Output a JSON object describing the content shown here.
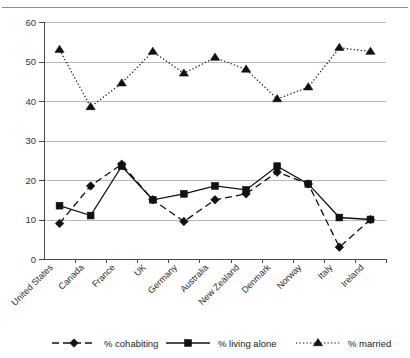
{
  "chart_data": {
    "type": "line",
    "title": "",
    "xlabel": "",
    "ylabel": "",
    "ylim": [
      0,
      60
    ],
    "ytick_step": 10,
    "yticks": [
      0,
      10,
      20,
      30,
      40,
      50,
      60
    ],
    "grid": "horizontal",
    "legend_position": "bottom",
    "categories": [
      "United States",
      "Canada",
      "France",
      "UK",
      "Germany",
      "Australia",
      "New Zealand",
      "Denmark",
      "Norway",
      "Italy",
      "Ireland"
    ],
    "series": [
      {
        "name": "% cohabiting",
        "marker": "diamond",
        "linestyle": "dashed",
        "color": "#111111",
        "values": [
          9,
          18.5,
          24,
          15,
          9.5,
          15,
          16.5,
          22,
          19,
          3,
          10
        ]
      },
      {
        "name": "% living alone",
        "marker": "square",
        "linestyle": "solid",
        "color": "#111111",
        "values": [
          13.5,
          11,
          23.5,
          15,
          16.5,
          18.5,
          17.5,
          23.5,
          19,
          10.5,
          10
        ]
      },
      {
        "name": "% married",
        "marker": "triangle",
        "linestyle": "dotted",
        "color": "#111111",
        "values": [
          53,
          38.5,
          44.5,
          52.5,
          47,
          51,
          48,
          40.5,
          43.5,
          53.5,
          52.5
        ]
      }
    ]
  },
  "axis": {
    "y_labels": [
      "60",
      "50",
      "40",
      "30",
      "20",
      "10",
      "0"
    ]
  },
  "legend": {
    "items": [
      {
        "label": "% cohabiting",
        "marker": "diamond-marker-icon",
        "linestyle": "dashed"
      },
      {
        "label": "% living alone",
        "marker": "square-marker-icon",
        "linestyle": "solid"
      },
      {
        "label": "% married",
        "marker": "triangle-marker-icon",
        "linestyle": "dotted"
      }
    ]
  }
}
